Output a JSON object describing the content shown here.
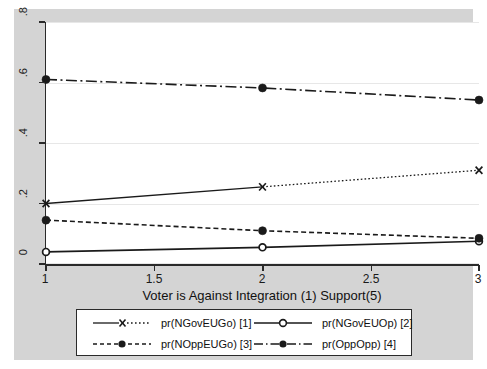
{
  "chart_data": {
    "type": "line",
    "title": "",
    "xlabel": "Voter is Against Integration (1) Support(5)",
    "ylabel": "",
    "x": [
      1,
      2,
      3
    ],
    "xlim": [
      1,
      3
    ],
    "ylim": [
      0,
      0.8
    ],
    "xticks": [
      "1",
      "1.5",
      "2",
      "2.5",
      "3"
    ],
    "xtick_values": [
      1,
      1.5,
      2,
      2.5,
      3
    ],
    "yticks": [
      "0",
      ".2",
      ".4",
      ".6",
      ".8"
    ],
    "ytick_values": [
      0,
      0.2,
      0.4,
      0.6,
      0.8
    ],
    "grid": "horizontal",
    "legend_position": "below-axis",
    "series": [
      {
        "name": "pr(NGovEUGo) [1]",
        "values": [
          0.2,
          0.255,
          0.31
        ],
        "marker": "x-marker",
        "linestyle": "solid-dotted",
        "color": "#1a1a1a"
      },
      {
        "name": "pr(NGovEUOp) [2]",
        "values": [
          0.04,
          0.055,
          0.075
        ],
        "marker": "hollow-circle-marker",
        "linestyle": "solid",
        "color": "#1a1a1a"
      },
      {
        "name": "pr(NOppEUGo) [3]",
        "values": [
          0.145,
          0.11,
          0.085
        ],
        "marker": "filled-circle-marker",
        "linestyle": "dashed",
        "color": "#1a1a1a"
      },
      {
        "name": "pr(OppOpp) [4]",
        "values": [
          0.61,
          0.582,
          0.542
        ],
        "marker": "filled-circle-marker",
        "linestyle": "dash-dot",
        "color": "#1a1a1a"
      }
    ]
  },
  "legend": {
    "entries": [
      {
        "label": "pr(NGovEUGo) [1]"
      },
      {
        "label": "pr(NGovEUOp) [2]"
      },
      {
        "label": "pr(NOppEUGo) [3]"
      },
      {
        "label": "pr(OppOpp) [4]"
      }
    ]
  },
  "colors": {
    "figure_background": "#d4d4d4",
    "plot_background": "#ffffff",
    "axis": "#2a2a2a",
    "gridline": "#e7e7e7",
    "series": "#1a1a1a"
  }
}
